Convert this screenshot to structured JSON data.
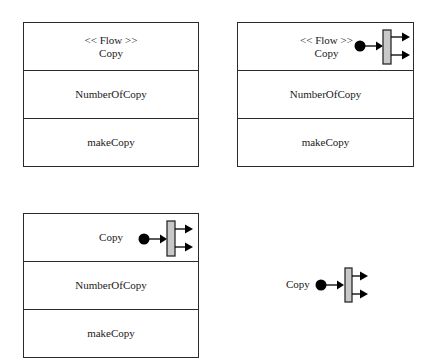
{
  "colors": {
    "stroke": "#2a2a2a",
    "bar_fill": "#c8c8c8",
    "dot_fill": "#000000",
    "background": "#ffffff"
  },
  "diagrams": [
    {
      "id": "box-1",
      "name_compartment": {
        "stereotype": "<< Flow >>",
        "name": "Copy"
      },
      "attribute": "NumberOfCopy",
      "operation": "makeCopy",
      "has_flow_icon": false
    },
    {
      "id": "box-2",
      "name_compartment": {
        "stereotype": "<< Flow >>",
        "name": "Copy"
      },
      "attribute": "NumberOfCopy",
      "operation": "makeCopy",
      "has_flow_icon": true,
      "icon": "flow-fork-icon"
    },
    {
      "id": "box-3",
      "name_compartment": {
        "stereotype": "",
        "name": "Copy"
      },
      "attribute": "NumberOfCopy",
      "operation": "makeCopy",
      "has_flow_icon": true,
      "icon": "flow-fork-icon"
    },
    {
      "id": "standalone-4",
      "label": "Copy",
      "has_flow_icon": true,
      "icon": "flow-fork-icon"
    }
  ]
}
